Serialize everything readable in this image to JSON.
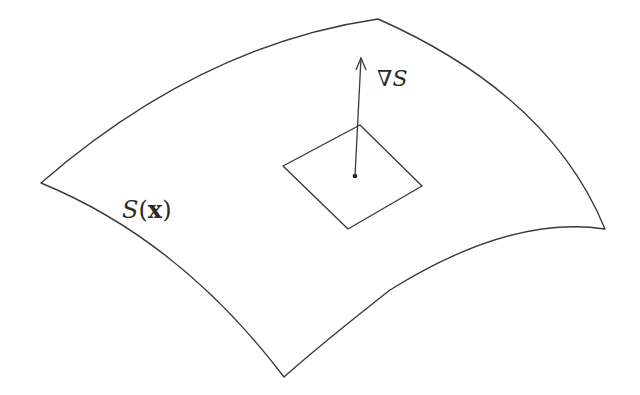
{
  "diagram": {
    "type": "surface-with-gradient",
    "colors": {
      "background": "#ffffff",
      "stroke": "#3a3a3a"
    },
    "surface": {
      "label": {
        "name": "S",
        "open": "(",
        "var": "x",
        "close": ")"
      },
      "corners": {
        "left": [
          41,
          183
        ],
        "top_right": [
          378,
          19
        ],
        "right": [
          605,
          229
        ],
        "bottom": [
          284,
          377
        ]
      }
    },
    "patch": {
      "corners": {
        "left": [
          283,
          166
        ],
        "top": [
          360,
          125
        ],
        "right": [
          422,
          186
        ],
        "bottom": [
          348,
          229
        ]
      },
      "point": [
        355,
        176
      ]
    },
    "gradient_vector": {
      "from": [
        355,
        176
      ],
      "to": [
        361,
        58
      ],
      "label": {
        "nabla": "∇",
        "name": "S"
      }
    }
  }
}
